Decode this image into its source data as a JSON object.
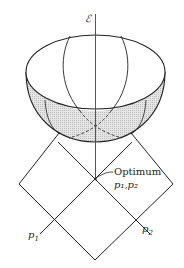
{
  "diagram": {
    "axis_label": "ℰ",
    "optimum_label": "Optimum",
    "optimum_params": "p₁,p₂",
    "p1_label": "p",
    "p1_sub": "1",
    "p2_label": "p",
    "p2_sub": "2",
    "colors": {
      "line": "#222222",
      "shade": "#d8d8d8"
    }
  }
}
